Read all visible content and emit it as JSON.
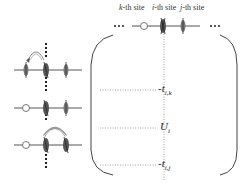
{
  "header": {
    "site_labels": [
      {
        "var": "k",
        "suffix": "-th site"
      },
      {
        "var": "i",
        "suffix": "-th site"
      },
      {
        "var": "j",
        "suffix": "-th site"
      }
    ],
    "ellipsis_left": "•••",
    "ellipsis_right": "•••"
  },
  "matrix": {
    "entries": [
      {
        "prefix": "-",
        "symbol": "t",
        "subscript": "i,k"
      },
      {
        "prefix": "",
        "symbol": "U",
        "subscript": "i"
      },
      {
        "prefix": "-",
        "symbol": "t",
        "subscript": "i,j"
      }
    ]
  },
  "configurations": [
    {
      "name": "hop-from-k",
      "sites": [
        "spin",
        "doublon",
        "spin"
      ],
      "arrow": "i-to-k"
    },
    {
      "name": "diagonal",
      "sites": [
        "empty",
        "doublon",
        "spin"
      ],
      "arrow": "none"
    },
    {
      "name": "hop-from-j",
      "sites": [
        "empty",
        "doublon",
        "doublon"
      ],
      "arrow": "i-to-j"
    }
  ],
  "colors": {
    "line": "#555555",
    "dotted": "#888888",
    "bracket": "#444444",
    "spin_fill": "#666666",
    "empty_fill": "#ffffff"
  }
}
